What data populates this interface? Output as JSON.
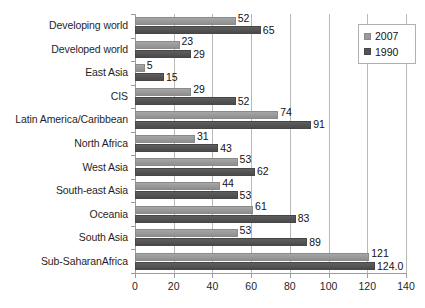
{
  "chart_data": {
    "type": "bar",
    "orientation": "horizontal",
    "title": "",
    "xlabel": "",
    "ylabel": "",
    "xlim": [
      0,
      140
    ],
    "xticks": [
      0,
      20,
      40,
      60,
      80,
      100,
      120,
      140
    ],
    "grid": true,
    "legend_position": "top-right",
    "categories": [
      "Developing world",
      "Developed world",
      "East Asia",
      "CIS",
      "Latin America/Caribbean",
      "North Africa",
      "West Asia",
      "South-east Asia",
      "Oceania",
      "South Asia",
      "Sub-SaharanAfrica"
    ],
    "series": [
      {
        "name": "2007",
        "color": "#9a9a9a",
        "values": [
          52,
          23,
          5,
          29,
          74,
          31,
          53,
          44,
          61,
          53,
          121
        ],
        "labels": [
          "52",
          "23",
          "5",
          "29",
          "74",
          "31",
          "53",
          "44",
          "61",
          "53",
          "121"
        ]
      },
      {
        "name": "1990",
        "color": "#535353",
        "values": [
          65,
          29,
          15,
          52,
          91,
          43,
          62,
          53,
          83,
          89,
          124.0
        ],
        "labels": [
          "65",
          "29",
          "15",
          "52",
          "91",
          "43",
          "62",
          "53",
          "83",
          "89",
          "124.0"
        ]
      }
    ]
  },
  "legend": {
    "items": [
      {
        "label": "2007",
        "swatch": "series-2007"
      },
      {
        "label": "1990",
        "swatch": "series-1990"
      }
    ]
  },
  "colors": {
    "series_2007": "#9a9a9a",
    "series_1990": "#535353",
    "gridline": "#b9b9b9",
    "axis": "#9d9d9d",
    "text": "#1a1a1a",
    "background": "#ffffff"
  }
}
